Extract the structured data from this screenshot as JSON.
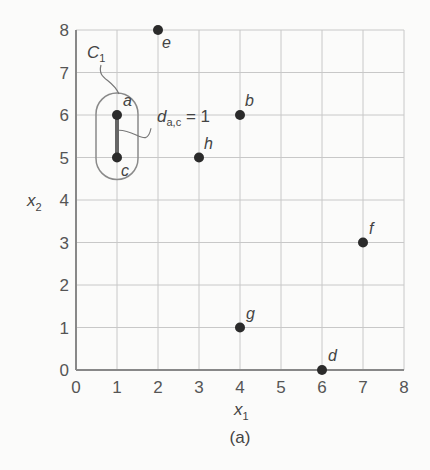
{
  "chart_data": {
    "type": "scatter",
    "title": "",
    "caption": "(a)",
    "xlabel": "x1",
    "ylabel": "x2",
    "xlim": [
      0,
      8
    ],
    "ylim": [
      0,
      8
    ],
    "grid": true,
    "x_ticks": [
      0,
      1,
      2,
      3,
      4,
      5,
      6,
      7,
      8
    ],
    "y_ticks": [
      0,
      1,
      2,
      3,
      4,
      5,
      6,
      7,
      8
    ],
    "points": [
      {
        "label": "a",
        "x": 1,
        "y": 6
      },
      {
        "label": "b",
        "x": 4,
        "y": 6
      },
      {
        "label": "c",
        "x": 1,
        "y": 5
      },
      {
        "label": "d",
        "x": 6,
        "y": 0
      },
      {
        "label": "e",
        "x": 2,
        "y": 8
      },
      {
        "label": "f",
        "x": 7,
        "y": 3
      },
      {
        "label": "g",
        "x": 4,
        "y": 1
      },
      {
        "label": "h",
        "x": 3,
        "y": 5
      }
    ],
    "annotations": [
      {
        "type": "cluster",
        "label": "C1",
        "members": [
          "a",
          "c"
        ]
      },
      {
        "type": "distance",
        "label": "d_{a,c} = 1",
        "from": "a",
        "to": "c",
        "value": 1
      }
    ]
  },
  "labels": {
    "xlabel_main": "x",
    "xlabel_sub": "1",
    "ylabel_main": "x",
    "ylabel_sub": "2",
    "cluster_main": "C",
    "cluster_sub": "1",
    "dist_main": "d",
    "dist_sub": "a,c",
    "dist_value": " = 1",
    "caption": "(a)"
  },
  "colors": {
    "point": "#2b2b2b",
    "grid": "#c8c8c8",
    "axis": "#888888",
    "cluster_outline": "#8a8a8a",
    "edge": "#555555"
  }
}
